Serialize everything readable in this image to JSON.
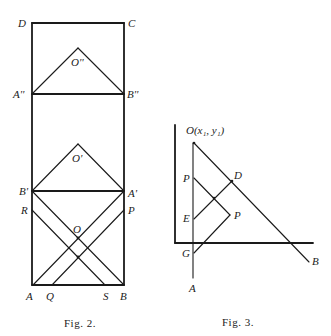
{
  "figures": [
    {
      "id": "fig2",
      "caption": "Fig. 2.",
      "labels": {
        "D": "D",
        "C": "C",
        "O2": "O''",
        "A2": "A''",
        "B2": "B''",
        "O1": "O'",
        "B1": "B'",
        "A1": "A'",
        "R": "R",
        "P": "P",
        "O": "O",
        "A": "A",
        "Q": "Q",
        "S": "S",
        "B": "B"
      }
    },
    {
      "id": "fig3",
      "caption": "Fig. 3.",
      "labels": {
        "O": "O(x₁, y₁)",
        "P_left": "P",
        "D": "D",
        "E": "E",
        "P_right": "P",
        "G": "G",
        "A": "A",
        "B": "B"
      }
    }
  ]
}
